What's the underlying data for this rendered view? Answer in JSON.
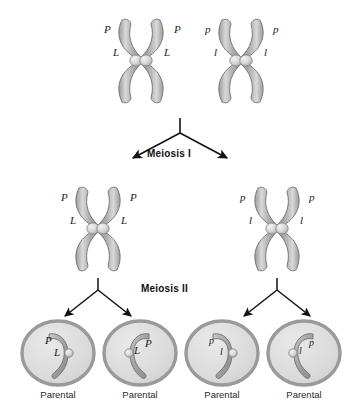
{
  "figure": {
    "title_visible": false,
    "background": "#ffffff",
    "ink": "#1b1b1b"
  },
  "palette": {
    "chromosome_arm_dark": "#8d8d8d",
    "chromosome_arm_mid": "#a8a8a8",
    "chromosome_arm_light": "#d6d6d6",
    "chromosome_outline": "#6f6f6f",
    "centromere_light": "#e2e2e2",
    "centromere_outline": "#8a8a8a",
    "cell_membrane": "#9a9a9a",
    "cell_interior": "#dcdcdc",
    "arrow": "#121212"
  },
  "stages": {
    "meiosis_one_label": "Meiosis I",
    "meiosis_two_label": "Meiosis II"
  },
  "top_row": {
    "name": "homologous-pair-before-meiosis",
    "chromosomes": [
      {
        "id": "top-left-homolog",
        "labels": [
          {
            "text": "P",
            "side": "left",
            "tier": "upper"
          },
          {
            "text": "P",
            "side": "right",
            "tier": "upper"
          },
          {
            "text": "L",
            "side": "left",
            "tier": "lower"
          },
          {
            "text": "L",
            "side": "right",
            "tier": "lower"
          }
        ]
      },
      {
        "id": "top-right-homolog",
        "labels": [
          {
            "text": "p",
            "side": "left",
            "tier": "upper"
          },
          {
            "text": "p",
            "side": "right",
            "tier": "upper"
          },
          {
            "text": "l",
            "side": "left",
            "tier": "lower"
          },
          {
            "text": "l",
            "side": "right",
            "tier": "lower"
          }
        ]
      }
    ]
  },
  "middle_row": {
    "name": "products-of-meiosis-one",
    "chromosomes": [
      {
        "id": "middle-left-chromosome",
        "labels": [
          {
            "text": "P",
            "side": "left",
            "tier": "upper"
          },
          {
            "text": "P",
            "side": "right",
            "tier": "upper"
          },
          {
            "text": "L",
            "side": "left",
            "tier": "lower"
          },
          {
            "text": "L",
            "side": "right",
            "tier": "lower"
          }
        ]
      },
      {
        "id": "middle-right-chromosome",
        "labels": [
          {
            "text": "p",
            "side": "left",
            "tier": "upper"
          },
          {
            "text": "p",
            "side": "right",
            "tier": "upper"
          },
          {
            "text": "l",
            "side": "left",
            "tier": "lower"
          },
          {
            "text": "l",
            "side": "right",
            "tier": "lower"
          }
        ]
      }
    ]
  },
  "gametes": {
    "name": "meiosis-two-products",
    "count": 4,
    "cells": [
      {
        "id": "gamete-1",
        "allele_top": "P",
        "allele_bottom": "L",
        "caption": "Parental"
      },
      {
        "id": "gamete-2",
        "allele_top": "L",
        "allele_bottom": "P",
        "caption": "Parental"
      },
      {
        "id": "gamete-3",
        "allele_top": "p",
        "allele_bottom": "l",
        "caption": "Parental"
      },
      {
        "id": "gamete-4",
        "allele_top": "l",
        "allele_bottom": "p",
        "caption": "Parental"
      }
    ]
  }
}
